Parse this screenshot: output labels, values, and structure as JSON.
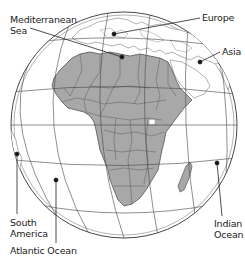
{
  "map": {
    "type": "orthographic-globe",
    "centered_on": "Africa",
    "colors": {
      "land_highlight": "#a8a8a8",
      "land_other": "#ffffff",
      "ocean": "#ffffff",
      "borders": "#555555",
      "graticule": "#444444",
      "leader_lines": "#222222"
    },
    "labels": {
      "mediterranean": "Mediterranean\nSea",
      "europe": "Europe",
      "asia": "Asia",
      "south_america": "South\nAmerica",
      "atlantic": "Atlantic Ocean",
      "indian": "Indian\nOcean"
    }
  }
}
